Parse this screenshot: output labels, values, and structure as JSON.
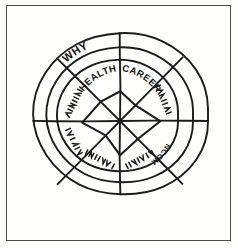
{
  "page": {
    "background_color": "#fdfdfb",
    "border_color": "#4a4a48",
    "ink_color": "#1b1b1a",
    "width": 238,
    "height": 248
  },
  "diagram": {
    "name": "wheel-of-life",
    "type": "radial-sector-wheel",
    "center": {
      "x": 120,
      "y": 121
    },
    "ring_radii": [
      58,
      73,
      88
    ],
    "ring_count": 3,
    "sector_count": 8,
    "spoke_angles_deg": [
      0,
      45,
      90,
      135,
      180,
      225,
      270,
      315
    ],
    "style": "hand-drawn pen sketch"
  },
  "labels": {
    "legible": [
      {
        "text": "WHY",
        "ring": "outer",
        "angle_deg": 113,
        "radius": 80,
        "rotation_deg": -28
      },
      {
        "text": "HEALTH",
        "ring": "inner",
        "angle_deg": 113,
        "radius": 50,
        "rotation_deg": -25
      },
      {
        "text": "CAREER",
        "ring": "inner",
        "angle_deg": 67,
        "radius": 50,
        "rotation_deg": 25
      },
      {
        "text": "INCOME",
        "ring": "inner",
        "angle_deg": 338,
        "radius": 50,
        "rotation_deg": 112
      }
    ],
    "illegible_count": 5,
    "illegible_note": "remaining sector labels are unreadable handwritten scribbles"
  },
  "plot": {
    "name": "score-polygon",
    "description": "irregular hand-drawn polygon plotting a rating along each spoke",
    "scores_by_spoke": [
      {
        "angle_deg": 90,
        "radius": 30
      },
      {
        "angle_deg": 45,
        "radius": 22
      },
      {
        "angle_deg": 0,
        "radius": 40
      },
      {
        "angle_deg": 315,
        "radius": 25
      },
      {
        "angle_deg": 270,
        "radius": 34
      },
      {
        "angle_deg": 225,
        "radius": 20
      },
      {
        "angle_deg": 180,
        "radius": 38
      },
      {
        "angle_deg": 135,
        "radius": 27
      }
    ]
  }
}
